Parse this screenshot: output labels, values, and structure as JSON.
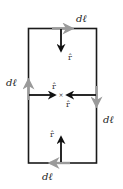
{
  "figure": {
    "colors": {
      "loop_line": "#1a1a1a",
      "dl_arrow": "#9a9a9a",
      "rhat_arrow": "#111111",
      "background": "#ffffff"
    },
    "labels": {
      "dl_top": "dℓ",
      "dl_left": "dℓ",
      "dl_right": "dℓ",
      "dl_bottom": "dℓ",
      "rhat_top": "r̂",
      "rhat_left": "r̂",
      "rhat_right": "r̂",
      "rhat_bottom": "r̂",
      "center_mark": "×"
    }
  }
}
